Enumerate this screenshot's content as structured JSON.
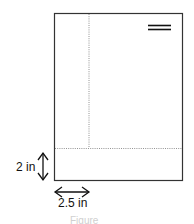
{
  "diagram": {
    "labels": {
      "bottom_margin": "2 in",
      "left_margin": "2.5 in"
    },
    "caption": "Figure",
    "colors": {
      "frame": "#333333",
      "guide": "#777777",
      "text": "#111111"
    }
  }
}
